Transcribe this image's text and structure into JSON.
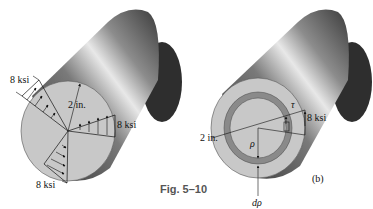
{
  "figure": {
    "caption": "Fig. 5–10",
    "left": {
      "labels": {
        "stress_top": "8 ksi",
        "stress_right": "8 ksi",
        "stress_bottom": "8 ksi",
        "radius": "2 in."
      }
    },
    "right": {
      "labels": {
        "radius": "2 in.",
        "tau": "τ",
        "stress": "8 ksi",
        "rho": "ρ",
        "d_rho": "dρ",
        "part": "(b)"
      }
    }
  },
  "colors": {
    "face": "#c8c8c8",
    "ring": "#8a8a8a",
    "cylinder_dark": "#3c3c3c",
    "cylinder_light": "#e6e6e6",
    "back_cap": "#2e2e2e",
    "caption": "#555555"
  }
}
